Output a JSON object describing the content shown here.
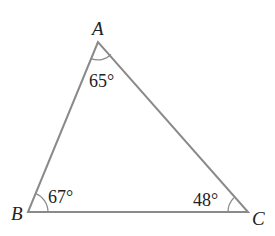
{
  "diagram": {
    "type": "triangle",
    "colors": {
      "line": "#8a8a8a",
      "text": "#222222",
      "background": "#ffffff"
    },
    "vertices": {
      "A": {
        "label": "A",
        "x": 98,
        "y": 42
      },
      "B": {
        "label": "B",
        "x": 28,
        "y": 212
      },
      "C": {
        "label": "C",
        "x": 248,
        "y": 212
      }
    },
    "angles": {
      "A": {
        "value": "65°"
      },
      "B": {
        "value": "67°"
      },
      "C": {
        "value": "48°"
      }
    }
  }
}
